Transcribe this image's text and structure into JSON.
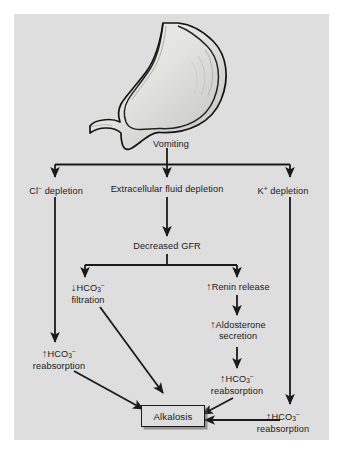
{
  "figure": {
    "panel_color": "#dedede",
    "line_color": "#1a1a1a",
    "text_color": "#1a1a1a"
  },
  "illustration": {
    "name": "stomach-illustration",
    "label": "stomach",
    "fill_light": "#e8e8e6",
    "fill_mid": "#c9c9c6",
    "outline": "#141414"
  },
  "nodes": {
    "vomiting": {
      "text": "Vomiting"
    },
    "cl_depletion": {
      "prefix": "Cl",
      "sup": "−",
      "suffix": " depletion"
    },
    "ecf_depletion": {
      "text": "Extracellular fluid depletion"
    },
    "k_depletion": {
      "prefix": "K",
      "sup": "+",
      "suffix": " depletion"
    },
    "decreased_gfr": {
      "text": "Decreased GFR"
    },
    "hco3_filtration": {
      "arrow": "↓",
      "line1_pre": "HCO",
      "line1_sub": "3",
      "line1_sup": "−",
      "line2": "filtration"
    },
    "renin_release": {
      "arrow": "↑",
      "text": "Renin release"
    },
    "aldosterone_secretion": {
      "arrow": "↑",
      "line1": "Aldosterone",
      "line2": "secretion"
    },
    "hco3_reabsorption_left": {
      "arrow": "↑",
      "line1_pre": "HCO",
      "line1_sub": "3",
      "line1_sup": "−",
      "line2": "reabsorption"
    },
    "hco3_reabsorption_middle": {
      "arrow": "↑",
      "line1_pre": "HCO",
      "line1_sub": "3",
      "line1_sup": "−",
      "line2": "reabsorption"
    },
    "hco3_reabsorption_right": {
      "arrow": "↑",
      "line1_pre": "HCO",
      "line1_sub": "3",
      "line1_sup": "−",
      "line2": "reabsorption"
    },
    "alkalosis": {
      "text": "Alkalosis"
    }
  }
}
